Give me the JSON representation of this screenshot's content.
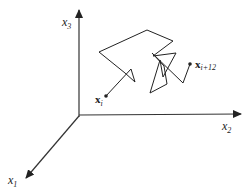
{
  "diagram": {
    "type": "3d-axes-trajectory",
    "axes": [
      {
        "id": "x3",
        "label": "x",
        "subscript": "3",
        "direction": "up"
      },
      {
        "id": "x2",
        "label": "x",
        "subscript": "2",
        "direction": "right"
      },
      {
        "id": "x1",
        "label": "x",
        "subscript": "1",
        "direction": "down-left"
      }
    ],
    "trajectory": {
      "start_label": {
        "base": "x",
        "subscript": "i"
      },
      "end_label": {
        "base": "x",
        "subscript": "i+12"
      },
      "steps": 12
    },
    "colors": {
      "line": "#222222",
      "background": "#ffffff"
    }
  }
}
